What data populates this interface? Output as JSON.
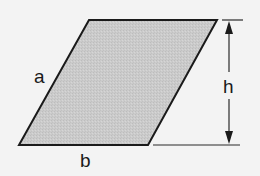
{
  "diagram": {
    "type": "parallelogram",
    "labels": {
      "side": "a",
      "base": "b",
      "height": "h"
    },
    "colors": {
      "background": "#f3f3f3",
      "fill": "#c9c9c9",
      "stroke": "#1a1a1a",
      "dimension_line": "#2a2a2a"
    }
  }
}
